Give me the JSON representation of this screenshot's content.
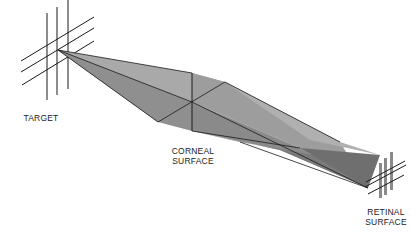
{
  "diagram": {
    "type": "optical ray diagram",
    "labels": {
      "target": "TARGET",
      "corneal_line1": "CORNEAL",
      "corneal_line2": "SURFACE",
      "retinal_line1": "RETINAL",
      "retinal_line2": "SURFACE"
    },
    "colors": {
      "line": "#1a1a1a",
      "beam_light": "#a8a8a8",
      "beam_mid": "#8c8c8c",
      "beam_dark": "#6e6e6e",
      "retinal_bars": "#8a8a8a",
      "background": "#ffffff"
    }
  }
}
